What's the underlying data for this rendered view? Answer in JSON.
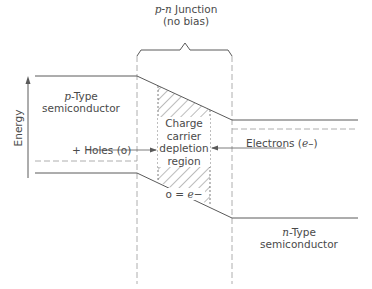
{
  "title": {
    "italic_part": "p-n",
    "line1_rest": " Junction",
    "line2": "(no bias)"
  },
  "axis": {
    "label": "Energy",
    "arrow": "up-arrow"
  },
  "regions": {
    "p_type": {
      "italic_part": "p",
      "line1_rest": "-Type",
      "line2": "semiconductor"
    },
    "n_type": {
      "italic_part": "n",
      "line1_rest": "-Type",
      "line2": "semiconductor"
    },
    "depletion": {
      "lines": [
        "Charge",
        "carrier",
        "depletion",
        "region"
      ],
      "equation_prefix": "o = ",
      "equation_italic": "e",
      "equation_suffix": "−"
    }
  },
  "carriers": {
    "holes": {
      "prefix": "+ Holes (o)"
    },
    "electrons": {
      "prefix": "Electrons (",
      "italic": "e",
      "suffix": "–)"
    }
  },
  "colors": {
    "line": "#5a5a5a",
    "dashed": "#9a9a9a",
    "text": "#4a4a4a",
    "background": "#ffffff"
  }
}
